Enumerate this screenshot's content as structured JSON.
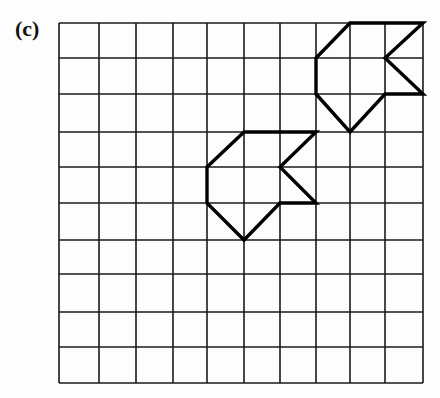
{
  "figure": {
    "label": "(c)",
    "grid": {
      "columns": 10,
      "rows": 10,
      "x_lines": [
        59,
        99,
        136,
        173,
        207,
        244,
        280,
        316,
        350,
        385,
        423
      ],
      "y_lines": [
        23,
        58,
        94,
        132,
        167,
        203,
        240,
        274,
        312,
        347,
        383
      ],
      "line_color": "#1a1a1a"
    },
    "shapes": [
      {
        "name": "upper-shape",
        "vertices_grid": [
          [
            8,
            0
          ],
          [
            10,
            0
          ],
          [
            9,
            1
          ],
          [
            10,
            2
          ],
          [
            9,
            2
          ],
          [
            8,
            3
          ],
          [
            7,
            2
          ],
          [
            7,
            1
          ]
        ]
      },
      {
        "name": "lower-shape",
        "vertices_grid": [
          [
            5,
            3
          ],
          [
            7,
            3
          ],
          [
            6,
            4
          ],
          [
            7,
            5
          ],
          [
            6,
            5
          ],
          [
            5,
            6
          ],
          [
            4,
            5
          ],
          [
            4,
            4
          ]
        ]
      }
    ],
    "shape_stroke": "#000000"
  }
}
